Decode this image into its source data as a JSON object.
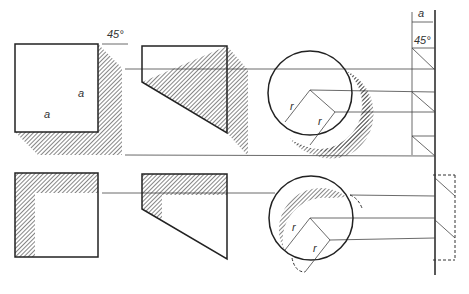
{
  "diagram": {
    "labels": {
      "angle_cube": "45°",
      "angle_side": "45°",
      "dim_a_side": "a",
      "dim_a_cube_right": "a",
      "dim_a_cube_bottom": "a",
      "radius_top_1": "r",
      "radius_top_2": "r",
      "radius_bottom_1": "r",
      "radius_bottom_2": "r"
    },
    "rows": [
      {
        "name": "top-row",
        "shapes": [
          "square-with-cast-shadow",
          "trapezoid-with-cast-shadow",
          "circle-with-cast-shadow"
        ]
      },
      {
        "name": "bottom-row",
        "shapes": [
          "square-with-inner-shadow",
          "trapezoid-with-inner-shadow",
          "circle-with-inner-shadow"
        ]
      }
    ],
    "colors": {
      "line": "#222222",
      "hatch": "#333333",
      "background": "#ffffff"
    }
  }
}
